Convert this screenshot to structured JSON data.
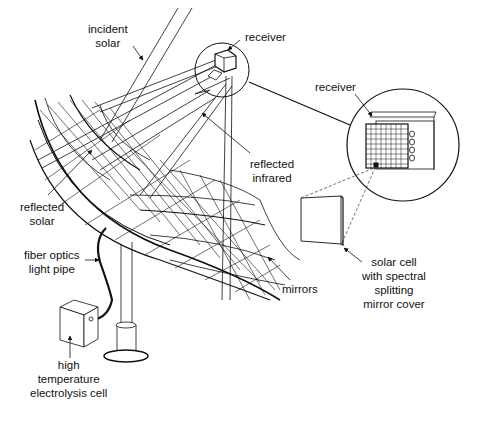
{
  "labels": {
    "incident_solar": [
      "incident",
      "solar"
    ],
    "receiver_small": "receiver",
    "receiver_inset": "receiver",
    "reflected_infrared": [
      "reflected",
      "infrared"
    ],
    "reflected_solar": [
      "reflected",
      "solar"
    ],
    "fiber_optics": [
      "fiber optics",
      "light pipe"
    ],
    "mirrors": "mirrors",
    "solar_cell": [
      "solar cell",
      "with spectral",
      "splitting",
      "mirror cover"
    ],
    "electrolysis": [
      "high",
      "temperature",
      "electrolysis cell"
    ]
  },
  "colors": {
    "line": "#111111",
    "background": "#ffffff"
  }
}
